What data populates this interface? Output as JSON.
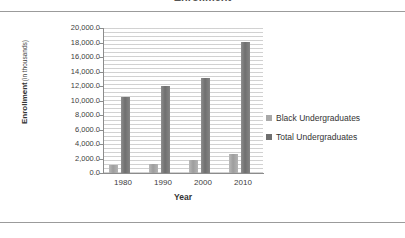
{
  "document": {
    "clipped_title": "Enrollment"
  },
  "chart_data": {
    "type": "bar",
    "title": "",
    "xlabel": "Year",
    "ylabel": "Enrollment",
    "ylabel_sub": "(in thousands)",
    "categories": [
      "1980",
      "1990",
      "2000",
      "2010"
    ],
    "series": [
      {
        "name": "Black Undergraduates",
        "color": "#a9a9a9",
        "values": [
          1100.0,
          1250.0,
          1730.0,
          2680.0
        ]
      },
      {
        "name": "Total Undergraduates",
        "color": "#6f6f6f",
        "values": [
          10470.0,
          11960.0,
          13150.0,
          18080.0
        ]
      }
    ],
    "ylim": [
      0,
      20000
    ],
    "ytick_step": 2000,
    "ytick_labels": [
      "20,000.0",
      "18,000.0",
      "16,000.0",
      "14,000.0",
      "12,000.0",
      "10,000.0",
      "8,000.0",
      "6,000.0",
      "4,000.0",
      "2,000.0",
      "0.0"
    ],
    "grid": true,
    "legend_position": "right"
  }
}
